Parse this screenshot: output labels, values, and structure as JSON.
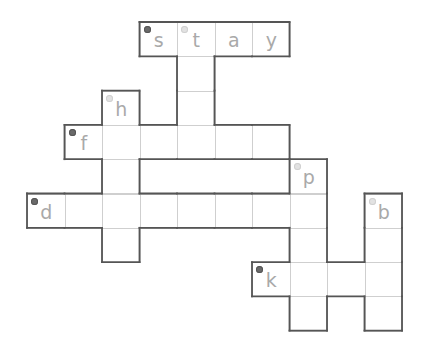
{
  "puzzle": {
    "type": "crossword",
    "grid": {
      "origin_x": 139.5,
      "origin_y": 22,
      "cell_w": 37.5,
      "cell_h": 34.3
    },
    "colors": {
      "outer_border": "#555555",
      "inner_line": "#cfcfcf",
      "letter": "#a9a9a9",
      "badge_dark": "#6a6a6a",
      "badge_light": "#e2e2e2"
    },
    "cells": [
      {
        "r": 0,
        "c": 0,
        "letter": "s",
        "badge": "dark"
      },
      {
        "r": 0,
        "c": 1,
        "letter": "t",
        "badge": "light"
      },
      {
        "r": 0,
        "c": 2,
        "letter": "a"
      },
      {
        "r": 0,
        "c": 3,
        "letter": "y"
      },
      {
        "r": 1,
        "c": 1,
        "letter": ""
      },
      {
        "r": 2,
        "c": 1,
        "letter": ""
      },
      {
        "r": 2,
        "c": -1,
        "letter": "h",
        "badge": "light"
      },
      {
        "r": 3,
        "c": -2,
        "letter": "f",
        "badge": "dark"
      },
      {
        "r": 3,
        "c": -1,
        "letter": ""
      },
      {
        "r": 3,
        "c": 0,
        "letter": ""
      },
      {
        "r": 3,
        "c": 1,
        "letter": ""
      },
      {
        "r": 3,
        "c": 2,
        "letter": ""
      },
      {
        "r": 3,
        "c": 3,
        "letter": ""
      },
      {
        "r": 4,
        "c": -1,
        "letter": ""
      },
      {
        "r": 4,
        "c": 4,
        "letter": "p",
        "badge": "light"
      },
      {
        "r": 5,
        "c": -3,
        "letter": "d",
        "badge": "dark"
      },
      {
        "r": 5,
        "c": -2,
        "letter": ""
      },
      {
        "r": 5,
        "c": -1,
        "letter": ""
      },
      {
        "r": 5,
        "c": 0,
        "letter": ""
      },
      {
        "r": 5,
        "c": 1,
        "letter": ""
      },
      {
        "r": 5,
        "c": 2,
        "letter": ""
      },
      {
        "r": 5,
        "c": 3,
        "letter": ""
      },
      {
        "r": 5,
        "c": 4,
        "letter": ""
      },
      {
        "r": 5,
        "c": 6,
        "letter": "b",
        "badge": "light"
      },
      {
        "r": 6,
        "c": -1,
        "letter": ""
      },
      {
        "r": 6,
        "c": 4,
        "letter": ""
      },
      {
        "r": 6,
        "c": 6,
        "letter": ""
      },
      {
        "r": 7,
        "c": 3,
        "letter": "k",
        "badge": "dark"
      },
      {
        "r": 7,
        "c": 4,
        "letter": ""
      },
      {
        "r": 7,
        "c": 5,
        "letter": ""
      },
      {
        "r": 7,
        "c": 6,
        "letter": ""
      },
      {
        "r": 8,
        "c": 4,
        "letter": ""
      },
      {
        "r": 8,
        "c": 6,
        "letter": ""
      }
    ],
    "enclosed_gaps": [
      {
        "r": 4,
        "c0": 0,
        "c1": 3
      }
    ]
  }
}
